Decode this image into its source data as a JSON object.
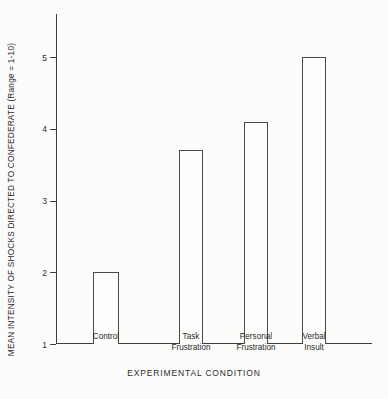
{
  "chart_data": {
    "type": "bar",
    "title": "",
    "xlabel": "EXPERIMENTAL CONDITION",
    "ylabel": "MEAN INTENSITY OF SHOCKS DIRECTED TO CONFEDERATE (Range = 1-10)",
    "categories": [
      "Control",
      "Task\nFrustration",
      "Personal\nFrustration",
      "Verbal\nInsult"
    ],
    "values": [
      2.0,
      3.7,
      4.1,
      5.0
    ],
    "ylim": [
      1,
      5.6
    ],
    "yticks": [
      1,
      2,
      3,
      4,
      5
    ],
    "ytick_labels": [
      "1",
      "2",
      "3",
      "4",
      "5"
    ],
    "grid": false,
    "legend": false,
    "colors": {
      "background": "#fbfbfa",
      "axis": "#3d3d3d",
      "bar_fill": "#fdfdfc",
      "bar_edge": "#4a4a4a",
      "text": "#2b2b2b"
    }
  },
  "layout": {
    "bars": [
      {
        "name": "bar-control",
        "left_px": 37,
        "width_px": 26
      },
      {
        "name": "bar-task-frustration",
        "left_px": 123,
        "width_px": 24
      },
      {
        "name": "bar-personal-frustration",
        "left_px": 188,
        "width_px": 24
      },
      {
        "name": "bar-verbal-insult",
        "left_px": 246,
        "width_px": 24
      }
    ],
    "x_label_positions": [
      {
        "left_px": 10,
        "width_px": 80
      },
      {
        "left_px": 95,
        "width_px": 80
      },
      {
        "left_px": 160,
        "width_px": 80
      },
      {
        "left_px": 218,
        "width_px": 80
      }
    ]
  }
}
